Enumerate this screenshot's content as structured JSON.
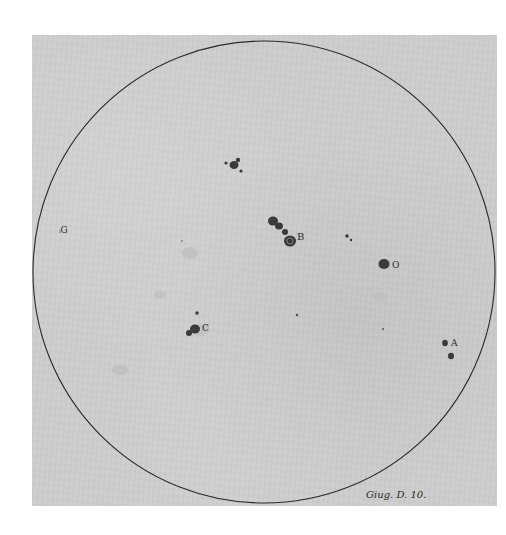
{
  "plate": {
    "caption": "Giug. D. 10.",
    "labels": {
      "A": "A",
      "B": "B",
      "C": "C",
      "O": "O",
      "G": "G"
    }
  },
  "colors": {
    "paper": "#cdcdcd",
    "ink": "#2a2a2a",
    "spot": "#3a3a3a"
  }
}
